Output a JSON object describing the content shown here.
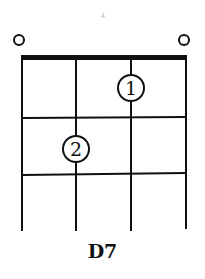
{
  "chord": {
    "name": "D7",
    "strings": 4,
    "frets_shown": 3,
    "open_strings": [
      1,
      4
    ],
    "fingers": [
      {
        "string": 3,
        "fret": 1,
        "finger": "1"
      },
      {
        "string": 2,
        "fret": 2,
        "finger": "2"
      }
    ],
    "top_mark": "4"
  }
}
